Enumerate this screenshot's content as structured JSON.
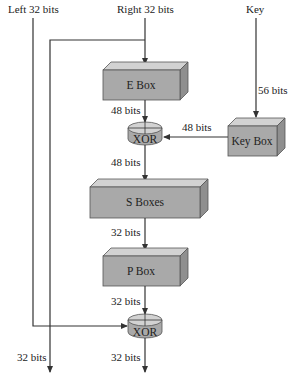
{
  "inputs": {
    "left": "Left 32 bits",
    "right": "Right 32 bits",
    "key": "Key"
  },
  "boxes": {
    "e_box": "E Box",
    "key_box": "Key Box",
    "s_boxes": "S Boxes",
    "p_box": "P Box",
    "xor_top": "XOR",
    "xor_bottom": "XOR"
  },
  "labels": {
    "key_to_keybox": "56 bits",
    "ebox_to_xor": "48 bits",
    "keybox_to_xor": "48 bits",
    "xor_to_sboxes": "48 bits",
    "sboxes_to_pbox": "32 bits",
    "pbox_to_xor": "32 bits",
    "left_output": "32 bits",
    "right_output": "32 bits"
  },
  "colors": {
    "box_front": "#a9a9a9",
    "box_top": "#d2d2d2",
    "box_side": "#8f8f8f",
    "line": "#333333"
  }
}
